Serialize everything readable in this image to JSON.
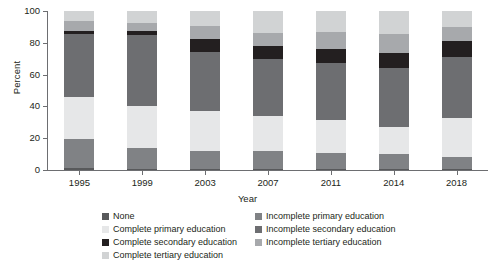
{
  "chart_data": {
    "type": "bar",
    "subtype": "stacked-bar-100",
    "title": "",
    "xlabel": "Year",
    "ylabel": "Percent",
    "ylim": [
      0,
      100
    ],
    "yticks": [
      0,
      20,
      40,
      60,
      80,
      100
    ],
    "grid": false,
    "legend_position": "bottom",
    "categories": [
      "1995",
      "1999",
      "2003",
      "2007",
      "2011",
      "2014",
      "2018"
    ],
    "series": [
      {
        "name": "None",
        "color": "#58595b",
        "values": [
          1.5,
          0.8,
          0.6,
          0.5,
          0.5,
          0.4,
          0.4
        ]
      },
      {
        "name": "Incomplete primary education",
        "color": "#808285",
        "values": [
          18.0,
          13.2,
          11.4,
          11.5,
          10.5,
          9.6,
          7.6
        ]
      },
      {
        "name": "Complete primary education",
        "color": "#e6e7e8",
        "values": [
          26.5,
          26.0,
          25.0,
          22.0,
          20.5,
          17.0,
          25.0
        ]
      },
      {
        "name": "Incomplete secondary education",
        "color": "#6d6e71",
        "values": [
          39.5,
          45.0,
          37.5,
          36.0,
          35.5,
          37.0,
          38.0
        ]
      },
      {
        "name": "Complete secondary education",
        "color": "#231f20",
        "values": [
          2.0,
          2.5,
          8.0,
          8.0,
          9.0,
          9.5,
          10.0
        ]
      },
      {
        "name": "Incomplete tertiary education",
        "color": "#a7a9ac",
        "values": [
          6.0,
          5.0,
          8.0,
          8.0,
          11.0,
          12.0,
          9.0
        ]
      },
      {
        "name": "Complete tertiary education",
        "color": "#d1d3d4",
        "values": [
          6.5,
          7.5,
          9.5,
          14.0,
          13.0,
          14.5,
          10.0
        ]
      }
    ]
  },
  "axes": {
    "y_title": "Percent",
    "x_title": "Year",
    "y_tick_labels": [
      "0",
      "20",
      "40",
      "60",
      "80",
      "100"
    ],
    "x_tick_labels": [
      "1995",
      "1999",
      "2003",
      "2007",
      "2011",
      "2014",
      "2018"
    ]
  },
  "legend": {
    "items": [
      {
        "label": "None",
        "color": "#58595b"
      },
      {
        "label": "Incomplete primary education",
        "color": "#808285"
      },
      {
        "label": "Complete primary education",
        "color": "#e6e7e8"
      },
      {
        "label": "Incomplete secondary education",
        "color": "#6d6e71"
      },
      {
        "label": "Complete secondary education",
        "color": "#231f20"
      },
      {
        "label": "Incomplete tertiary education",
        "color": "#a7a9ac"
      },
      {
        "label": "Complete tertiary education",
        "color": "#d1d3d4"
      }
    ]
  }
}
